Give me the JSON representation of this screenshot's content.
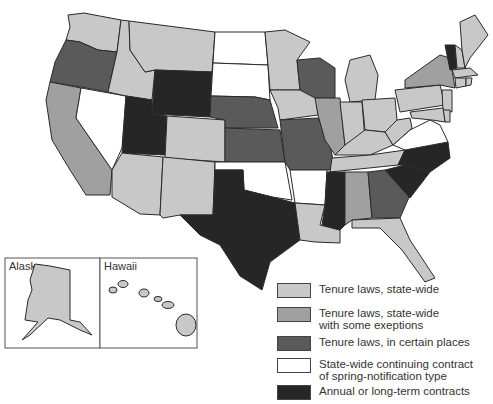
{
  "colors": {
    "tenure_statewide": "#c8c8c8",
    "tenure_exceptions": "#a0a0a0",
    "tenure_certain_places": "#5a5a5a",
    "continuing_contract": "#ffffff",
    "annual_contracts": "#262626"
  },
  "legend": [
    {
      "key": "tenure_statewide",
      "label": "Tenure laws, state-wide"
    },
    {
      "key": "tenure_exceptions",
      "label": "Tenure laws, state-wide\nwith some exeptions"
    },
    {
      "key": "tenure_certain_places",
      "label": "Tenure laws,  in certain places"
    },
    {
      "key": "continuing_contract",
      "label": "State-wide continuing contract\nof spring-notification type"
    },
    {
      "key": "annual_contracts",
      "label": "Annual or long-term contracts"
    }
  ],
  "insets": {
    "alaska": {
      "label": "Alaska",
      "category": "tenure_statewide"
    },
    "hawaii": {
      "label": "Hawaii",
      "category": "tenure_statewide"
    }
  },
  "states": {
    "WA": "tenure_statewide",
    "OR": "tenure_certain_places",
    "CA": "tenure_exceptions",
    "NV": "continuing_contract",
    "ID": "tenure_statewide",
    "MT": "tenure_statewide",
    "WY": "annual_contracts",
    "UT": "annual_contracts",
    "CO": "tenure_statewide",
    "AZ": "tenure_statewide",
    "NM": "tenure_statewide",
    "ND": "continuing_contract",
    "SD": "continuing_contract",
    "NE": "tenure_certain_places",
    "KS": "tenure_certain_places",
    "OK": "continuing_contract",
    "TX": "annual_contracts",
    "MN": "tenure_statewide",
    "IA": "tenure_statewide",
    "MO": "tenure_certain_places",
    "AR": "continuing_contract",
    "LA": "tenure_statewide",
    "WI": "tenure_certain_places",
    "IL": "tenure_exceptions",
    "MI": "tenure_statewide",
    "IN": "tenure_statewide",
    "OH": "tenure_statewide",
    "KY": "tenure_statewide",
    "TN": "tenure_statewide",
    "MS": "annual_contracts",
    "AL": "tenure_exceptions",
    "GA": "tenure_certain_places",
    "FL": "tenure_statewide",
    "SC": "annual_contracts",
    "NC": "annual_contracts",
    "VA": "continuing_contract",
    "WV": "tenure_statewide",
    "PA": "tenure_statewide",
    "NY": "tenure_exceptions",
    "VT": "annual_contracts",
    "NH": "tenure_statewide",
    "ME": "tenure_statewide",
    "MA": "tenure_statewide",
    "CT": "tenure_statewide",
    "RI": "tenure_statewide",
    "NJ": "tenure_statewide",
    "DE": "tenure_statewide",
    "MD": "tenure_statewide"
  }
}
